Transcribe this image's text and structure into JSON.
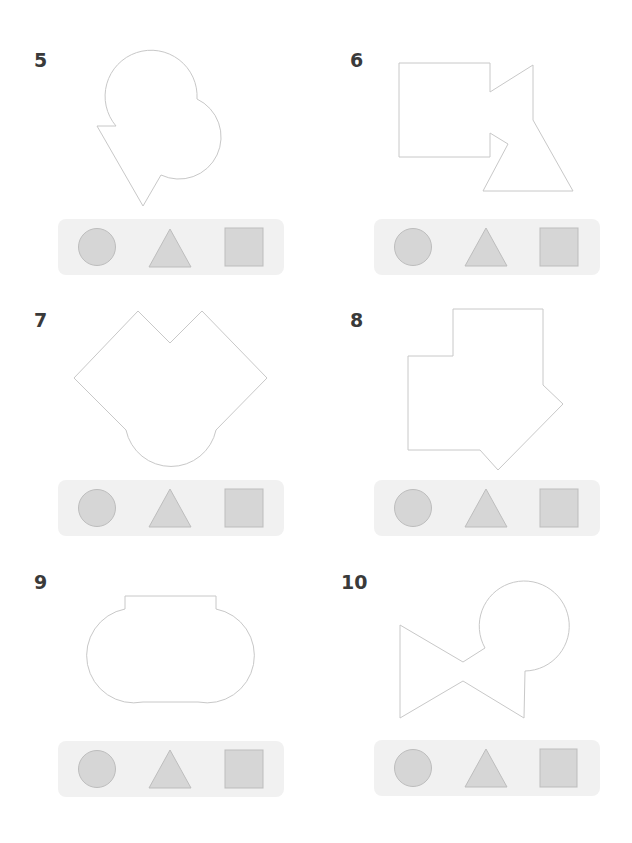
{
  "colors": {
    "outline": "#c8c8c8",
    "option_fill": "#d6d6d6",
    "option_stroke": "#bdbdbd",
    "bar_bg": "#f1f1f1",
    "number": "#3a3a3a"
  },
  "puzzles": [
    {
      "number": "5",
      "description": "two overlapping circles combined with a triangle",
      "options": [
        "circle",
        "triangle",
        "square"
      ]
    },
    {
      "number": "6",
      "description": "square combined with a triangle",
      "options": [
        "circle",
        "triangle",
        "square"
      ]
    },
    {
      "number": "7",
      "description": "two rotated squares combined with a circle",
      "options": [
        "circle",
        "triangle",
        "square"
      ]
    },
    {
      "number": "8",
      "description": "square shapes combined with a rotated square",
      "options": [
        "circle",
        "triangle",
        "square"
      ]
    },
    {
      "number": "9",
      "description": "two circles combined with squares",
      "options": [
        "circle",
        "triangle",
        "square"
      ]
    },
    {
      "number": "10",
      "description": "two triangles combined with a circle",
      "options": [
        "circle",
        "triangle",
        "square"
      ]
    }
  ]
}
